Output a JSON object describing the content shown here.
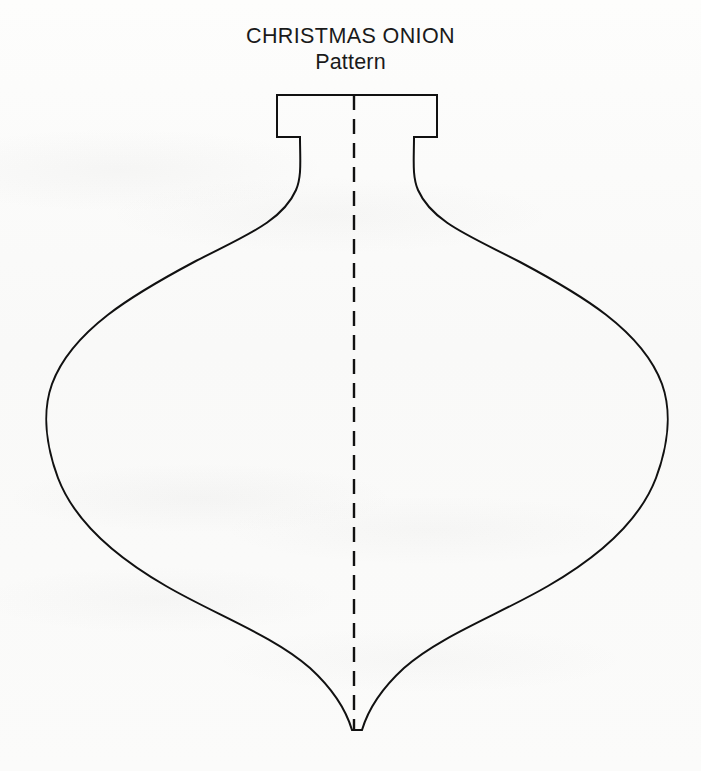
{
  "document": {
    "kind": "craft-pattern-sheet",
    "title_line_1": "CHRISTMAS ONION",
    "title_line_2": "Pattern",
    "background_color": "#fbfbfa",
    "ink_color": "#111111"
  },
  "title": {
    "line_1": "CHRISTMAS ONION",
    "line_2": "Pattern",
    "align": "center",
    "font_size_px": 21.5
  },
  "pattern": {
    "name": "christmas-onion-ornament-outline",
    "stroke_color": "#111111",
    "stroke_width_px": 2,
    "fill": "none",
    "description": "Symmetric onion / teardrop Christmas ornament outline with a rectangular notched cap at the top and a narrow tapering spike at the bottom.",
    "outline_path": "M 277 95 L 437 95 L 437 137 L 414 137 C 414 160 412 176 418 190 C 432 222 470 236 520 262 C 580 294 642 330 662 384 C 672 412 668 446 656 478 C 640 520 600 556 548 586 C 500 614 440 636 404 668 C 380 690 368 710 362 730 L 352 730 C 346 710 334 690 310 668 C 274 636 214 614 166 586 C 114 556 74 520 58 478 C 46 446 42 412 52 384 C 72 330 134 294 194 262 C 244 236 282 222 296 190 C 302 176 300 160 300 137 L 277 137 Z",
    "cap": {
      "top_y": 95,
      "left_x": 277,
      "right_x": 437,
      "notch_y": 137,
      "notch_inner_left_x": 300,
      "notch_inner_right_x": 414
    },
    "bulb": {
      "leftmost_x": 42,
      "rightmost_x": 665,
      "widest_y": 405
    },
    "tip": {
      "y": 730,
      "left_x": 352,
      "right_x": 362
    }
  },
  "fold_line": {
    "name": "center-fold-line",
    "style": "dashed",
    "x": 354,
    "y_start": 95,
    "y_end": 730,
    "dash_length_px": 15,
    "gap_length_px": 9,
    "stroke_color": "#111111",
    "stroke_width_px": 2.4
  }
}
